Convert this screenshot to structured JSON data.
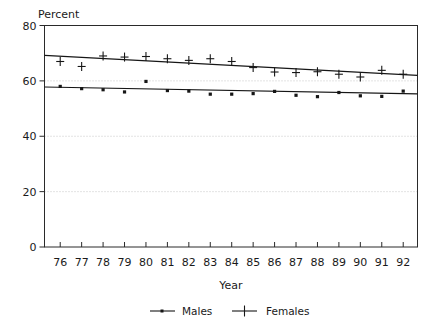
{
  "chart_data": {
    "type": "scatter",
    "title": "",
    "ylabel": "Percent",
    "xlabel": "Year",
    "ylim": [
      0,
      80
    ],
    "yticks": [
      0,
      20,
      40,
      60,
      80
    ],
    "ytick_labels": [
      "0",
      "20",
      "40",
      "60",
      "80"
    ],
    "grid": true,
    "grid_axis": "y",
    "legend_position": "bottom",
    "categories": [
      "76",
      "77",
      "78",
      "79",
      "80",
      "81",
      "82",
      "83",
      "84",
      "85",
      "86",
      "87",
      "88",
      "89",
      "90",
      "91",
      "92"
    ],
    "x": [
      76,
      77,
      78,
      79,
      80,
      81,
      82,
      83,
      84,
      85,
      86,
      87,
      88,
      89,
      90,
      91,
      92
    ],
    "series": [
      {
        "name": "Males",
        "marker": "dot",
        "values": [
          58.0,
          57.2,
          56.8,
          56.0,
          59.8,
          56.5,
          56.3,
          55.2,
          55.2,
          55.4,
          56.2,
          54.8,
          54.3,
          55.8,
          54.6,
          54.4,
          56.3
        ],
        "trend_start": 57.8,
        "trend_end": 55.3
      },
      {
        "name": "Females",
        "marker": "plus",
        "values": [
          67.0,
          65.2,
          69.0,
          68.6,
          68.8,
          68.0,
          67.4,
          68.0,
          67.0,
          64.8,
          63.2,
          63.0,
          63.3,
          62.4,
          61.4,
          63.8,
          62.4
        ],
        "trend_start": 69.2,
        "trend_end": 62.0
      }
    ],
    "annotations": []
  },
  "axes": {
    "y_axis_title": "Percent",
    "x_axis_title": "Year"
  },
  "legend": {
    "items": [
      {
        "label": "Males",
        "marker": "dot-line"
      },
      {
        "label": "Females",
        "marker": "plus-line"
      }
    ]
  },
  "colors": {
    "ink": "#161616",
    "grid": "#b9b9b9",
    "background": "#ffffff"
  }
}
